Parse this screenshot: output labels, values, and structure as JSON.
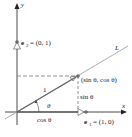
{
  "diagram": {
    "axes": {
      "x_label": "x",
      "y_label": "y"
    },
    "line_label": "L",
    "unit_vectors": {
      "e1": {
        "name": "e",
        "sub": "1",
        "value": "= (1, 0)"
      },
      "e2": {
        "name": "e",
        "sub": "2",
        "value": "= (0, 1)"
      }
    },
    "point_label": "(sin θ, cos θ)",
    "segment_labels": {
      "hypotenuse": "1",
      "angle": "θ",
      "horizontal": "cos θ",
      "vertical": "sin θ"
    },
    "colors": {
      "axis": "#4a4a4a",
      "line": "#8a8a8a",
      "vector": "#666666",
      "dashed": "#7a7a7a",
      "point": "#6a6a6a"
    }
  }
}
